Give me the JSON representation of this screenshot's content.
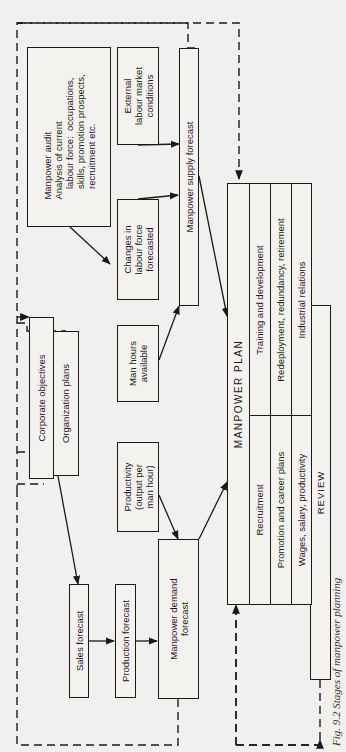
{
  "diagram": {
    "caption": "Fig. 9.2  Stages of manpower planning",
    "boxes": {
      "manpower_audit": "Manpower audit\nAnalysis of current\n    labour force:  occupations,\n    skills, promotion prospects,\n    recruitment etc.",
      "external_labour": "External\nlabour market\nconditions",
      "changes_labour": "Changes in\nlabour force\nforecasted",
      "supply_forecast": "Manpower supply forecast",
      "corporate_objectives": "Corporate objectives",
      "organization_plans": "Organization plans",
      "man_hours": "Man hours\navailable",
      "productivity": "Productivity\n(output per\nman hour)",
      "sales_forecast": "Sales forecast",
      "production_forecast": "Production forecast",
      "demand_forecast": "Manpower demand\nforecast",
      "manpower_plan": "MANPOWER PLAN",
      "review": "REVIEW"
    },
    "plan_rows": [
      {
        "left": "Recruitment",
        "right": "Training and development"
      },
      {
        "left": "Promotion and career plans",
        "right": "Redeployment, redundancy,  retirement"
      },
      {
        "left": "Wages, salary, productivity",
        "right": "Industrial relations"
      }
    ]
  }
}
